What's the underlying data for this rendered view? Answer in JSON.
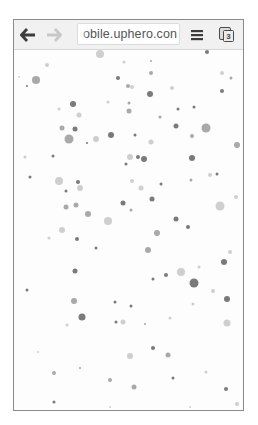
{
  "browser": {
    "toolbar": {
      "back_icon": "arrow-left-icon",
      "forward_icon": "arrow-right-icon",
      "url": "obile.uphero.con",
      "menu_icon": "hamburger-menu-icon",
      "tab_count": "3",
      "tab_icon": "tab-switcher-icon"
    }
  },
  "page": {
    "background": "#fdfdfd",
    "dot_colors": {
      "dark": "#7a7a7a",
      "mid": "#a9a9a9",
      "light": "#cfcfcf"
    },
    "dots": [
      [
        100,
        54,
        8,
        "light"
      ],
      [
        207,
        52,
        4,
        "dark"
      ],
      [
        47,
        65,
        4,
        "light"
      ],
      [
        124,
        62,
        3,
        "light"
      ],
      [
        151,
        61,
        2,
        "mid"
      ],
      [
        151,
        73,
        4,
        "mid"
      ],
      [
        36,
        80,
        8,
        "mid"
      ],
      [
        118,
        78,
        4,
        "dark"
      ],
      [
        128,
        86,
        4,
        "mid"
      ],
      [
        132,
        87,
        4,
        "light"
      ],
      [
        150,
        94,
        6,
        "dark"
      ],
      [
        172,
        88,
        4,
        "light"
      ],
      [
        222,
        73,
        4,
        "light"
      ],
      [
        231,
        78,
        3,
        "mid"
      ],
      [
        222,
        91,
        4,
        "dark"
      ],
      [
        27,
        86,
        2,
        "dark"
      ],
      [
        19,
        77,
        2,
        "light"
      ],
      [
        73,
        104,
        6,
        "dark"
      ],
      [
        59,
        109,
        3,
        "light"
      ],
      [
        79,
        115,
        5,
        "light"
      ],
      [
        129,
        103,
        3,
        "mid"
      ],
      [
        129,
        111,
        5,
        "mid"
      ],
      [
        108,
        102,
        3,
        "light"
      ],
      [
        178,
        109,
        3,
        "dark"
      ],
      [
        194,
        107,
        3,
        "dark"
      ],
      [
        160,
        117,
        3,
        "mid"
      ],
      [
        62,
        128,
        5,
        "mid"
      ],
      [
        75,
        129,
        5,
        "dark"
      ],
      [
        69,
        139,
        9,
        "mid"
      ],
      [
        96,
        139,
        6,
        "light"
      ],
      [
        111,
        135,
        6,
        "dark"
      ],
      [
        135,
        135,
        3,
        "dark"
      ],
      [
        151,
        142,
        5,
        "light"
      ],
      [
        87,
        143,
        2,
        "dark"
      ],
      [
        176,
        126,
        5,
        "dark"
      ],
      [
        192,
        136,
        4,
        "mid"
      ],
      [
        206,
        128,
        9,
        "mid"
      ],
      [
        237,
        145,
        6,
        "mid"
      ],
      [
        53,
        156,
        3,
        "dark"
      ],
      [
        130,
        157,
        6,
        "light"
      ],
      [
        138,
        157,
        4,
        "dark"
      ],
      [
        144,
        159,
        6,
        "dark"
      ],
      [
        25,
        157,
        3,
        "light"
      ],
      [
        192,
        158,
        6,
        "dark"
      ],
      [
        126,
        164,
        3,
        "dark"
      ],
      [
        30,
        177,
        3,
        "dark"
      ],
      [
        59,
        181,
        8,
        "light"
      ],
      [
        78,
        182,
        4,
        "dark"
      ],
      [
        80,
        188,
        6,
        "light"
      ],
      [
        66,
        191,
        3,
        "dark"
      ],
      [
        132,
        181,
        4,
        "light"
      ],
      [
        141,
        188,
        5,
        "light"
      ],
      [
        161,
        184,
        3,
        "dark"
      ],
      [
        210,
        175,
        4,
        "light"
      ],
      [
        217,
        174,
        3,
        "dark"
      ],
      [
        191,
        180,
        3,
        "mid"
      ],
      [
        152,
        199,
        5,
        "dark"
      ],
      [
        123,
        203,
        5,
        "dark"
      ],
      [
        131,
        210,
        3,
        "mid"
      ],
      [
        66,
        207,
        5,
        "mid"
      ],
      [
        76,
        205,
        5,
        "mid"
      ],
      [
        62,
        230,
        6,
        "light"
      ],
      [
        88,
        214,
        6,
        "mid"
      ],
      [
        108,
        221,
        8,
        "light"
      ],
      [
        176,
        219,
        5,
        "dark"
      ],
      [
        188,
        227,
        4,
        "dark"
      ],
      [
        157,
        233,
        6,
        "mid"
      ],
      [
        220,
        206,
        9,
        "light"
      ],
      [
        236,
        197,
        4,
        "light"
      ],
      [
        77,
        239,
        4,
        "dark"
      ],
      [
        49,
        238,
        3,
        "light"
      ],
      [
        96,
        248,
        3,
        "dark"
      ],
      [
        148,
        250,
        6,
        "mid"
      ],
      [
        230,
        252,
        4,
        "light"
      ],
      [
        224,
        262,
        6,
        "dark"
      ],
      [
        75,
        271,
        5,
        "dark"
      ],
      [
        181,
        272,
        8,
        "light"
      ],
      [
        166,
        275,
        4,
        "dark"
      ],
      [
        194,
        283,
        9,
        "dark"
      ],
      [
        199,
        267,
        3,
        "light"
      ],
      [
        153,
        279,
        3,
        "dark"
      ],
      [
        27,
        290,
        3,
        "dark"
      ],
      [
        74,
        301,
        6,
        "mid"
      ],
      [
        115,
        302,
        3,
        "dark"
      ],
      [
        131,
        306,
        3,
        "dark"
      ],
      [
        82,
        317,
        7,
        "dark"
      ],
      [
        116,
        322,
        3,
        "dark"
      ],
      [
        123,
        322,
        5,
        "light"
      ],
      [
        227,
        299,
        6,
        "dark"
      ],
      [
        227,
        323,
        7,
        "light"
      ],
      [
        213,
        291,
        4,
        "light"
      ],
      [
        153,
        348,
        4,
        "dark"
      ],
      [
        168,
        355,
        5,
        "mid"
      ],
      [
        130,
        356,
        6,
        "light"
      ],
      [
        54,
        373,
        4,
        "mid"
      ],
      [
        110,
        380,
        4,
        "mid"
      ],
      [
        173,
        378,
        3,
        "dark"
      ],
      [
        134,
        387,
        5,
        "mid"
      ],
      [
        226,
        389,
        4,
        "dark"
      ],
      [
        54,
        402,
        3,
        "dark"
      ],
      [
        237,
        404,
        4,
        "light"
      ],
      [
        67,
        325,
        3,
        "light"
      ],
      [
        38,
        352,
        2,
        "light"
      ],
      [
        80,
        368,
        2,
        "mid"
      ],
      [
        193,
        304,
        3,
        "light"
      ],
      [
        170,
        318,
        3,
        "light"
      ],
      [
        145,
        324,
        2,
        "mid"
      ],
      [
        206,
        372,
        3,
        "light"
      ],
      [
        190,
        407,
        2,
        "light"
      ],
      [
        110,
        407,
        2,
        "light"
      ]
    ]
  }
}
